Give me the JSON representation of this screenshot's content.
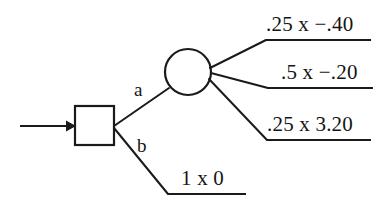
{
  "diagram": {
    "type": "decision-tree",
    "colors": {
      "stroke": "#1a1a1a",
      "background": "#ffffff",
      "text": "#151515"
    },
    "entry": {
      "name": "entry-arrow",
      "description": "arrow entering decision node from the left"
    },
    "nodes": [
      {
        "id": "decision-node",
        "shape": "square",
        "label": ""
      },
      {
        "id": "chance-node",
        "shape": "circle",
        "label": ""
      }
    ],
    "branches": [
      {
        "id": "branch-a",
        "label": "a",
        "from": "decision-node",
        "to": "chance-node"
      },
      {
        "id": "branch-b",
        "label": "b",
        "from": "decision-node",
        "to": "outcome-4"
      }
    ],
    "outcomes": [
      {
        "id": "outcome-1",
        "text": ".25 x −.40",
        "probability": ".25",
        "value": "−.40",
        "from": "chance-node"
      },
      {
        "id": "outcome-2",
        "text": ".5 x −.20",
        "probability": ".5",
        "value": "−.20",
        "from": "chance-node"
      },
      {
        "id": "outcome-3",
        "text": ".25 x 3.20",
        "probability": ".25",
        "value": "3.20",
        "from": "chance-node"
      },
      {
        "id": "outcome-4",
        "text": "1 x 0",
        "probability": "1",
        "value": "0",
        "from": "decision-node"
      }
    ]
  }
}
